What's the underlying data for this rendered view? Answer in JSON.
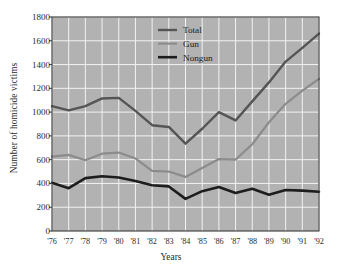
{
  "chart_data": {
    "type": "line",
    "title": "",
    "xlabel": "Years",
    "ylabel": "Number of homicide victims",
    "categories": [
      "'76",
      "'77",
      "'78",
      "'79",
      "'80",
      "'81",
      "'82",
      "'83",
      "'84",
      "'85",
      "'86",
      "'87",
      "'88",
      "'89",
      "'90",
      "'91",
      "'92"
    ],
    "x": [
      1976,
      1977,
      1978,
      1979,
      1980,
      1981,
      1982,
      1983,
      1984,
      1985,
      1986,
      1987,
      1988,
      1989,
      1990,
      1991,
      1992
    ],
    "ylim": [
      0,
      1800
    ],
    "ytick_values": [
      0,
      200,
      400,
      600,
      800,
      1000,
      1200,
      1400,
      1600,
      1800
    ],
    "ytick_labels": [
      "0",
      "200",
      "400",
      "600",
      "800",
      "1000",
      "1200",
      "1400",
      "1600",
      "1800"
    ],
    "grid": true,
    "grid_color": "#f2f2f2",
    "plot_background": "#b2b2b2",
    "legend_position": "upper-center",
    "series": [
      {
        "name": "Total",
        "color": "#555555",
        "width": 2.4,
        "values": [
          1050,
          1015,
          1050,
          1115,
          1120,
          1010,
          890,
          875,
          735,
          860,
          1000,
          930,
          1090,
          1250,
          1425,
          1540,
          1660
        ]
      },
      {
        "name": "Gun",
        "color": "#8c8c8c",
        "width": 2.2,
        "values": [
          625,
          640,
          595,
          650,
          660,
          610,
          505,
          500,
          455,
          530,
          605,
          600,
          730,
          915,
          1070,
          1180,
          1280
        ]
      },
      {
        "name": "Nongun",
        "color": "#1d1d1d",
        "width": 2.6,
        "values": [
          405,
          360,
          445,
          460,
          450,
          420,
          385,
          375,
          270,
          335,
          370,
          320,
          355,
          305,
          345,
          340,
          330
        ]
      }
    ]
  },
  "figure": {
    "background": "#ffffff",
    "axis_color": "#3a3a3a"
  }
}
